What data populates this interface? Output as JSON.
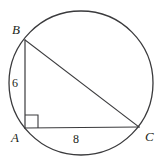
{
  "figure": {
    "background_color": "#ffffff",
    "stroke_color": "#3a3a3c",
    "label_color": "#231f20",
    "canvas": {
      "width": 161,
      "height": 166
    },
    "circle": {
      "cx": 81,
      "cy": 83,
      "r": 72,
      "stroke_width": 1.3,
      "fill": "none"
    },
    "vertices": [
      {
        "id": "A",
        "label": "A",
        "x": 25,
        "y": 128
      },
      {
        "id": "B",
        "label": "B",
        "x": 25,
        "y": 40
      },
      {
        "id": "C",
        "label": "C",
        "x": 139,
        "y": 127
      }
    ],
    "segments": [
      {
        "id": "AB",
        "from": "A",
        "to": "B",
        "stroke_width": 1.2
      },
      {
        "id": "AC",
        "from": "A",
        "to": "C",
        "stroke_width": 1.2
      },
      {
        "id": "BC",
        "from": "B",
        "to": "C",
        "stroke_width": 1.2
      }
    ],
    "right_angle": {
      "at_vertex": "A",
      "size": 13,
      "stroke_width": 1.1
    },
    "measures": [
      {
        "id": "AB",
        "segment": "AB",
        "value": "6"
      },
      {
        "id": "AC",
        "segment": "AC",
        "value": "8"
      }
    ]
  }
}
